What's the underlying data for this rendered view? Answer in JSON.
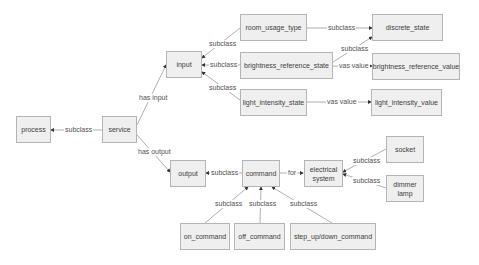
{
  "diagram": {
    "nodes": {
      "process": "process",
      "service": "service",
      "input": "input",
      "output": "output",
      "room_usage_type": "room_usage_type",
      "discrete_state": "discrete_state",
      "brightness_reference_state": "brightness_reference_state",
      "brightness_reference_value": "brightness_reference_value",
      "light_intensity_state": "light_intensity_state",
      "light_intensity_value": "light_intensity_value",
      "command": "command",
      "electrical_system": "electrical system",
      "socket": "socket",
      "dimmer_lamp": "dimmer lamp",
      "on_command": "on_command",
      "off_command": "off_command",
      "step_command": "step_up/down_command"
    },
    "edges": {
      "service_process": "subclass",
      "service_input": "has input",
      "service_output": "has output",
      "room_input": "subclass",
      "brightness_input": "subclass",
      "light_input": "subclass",
      "room_discrete": "subclass",
      "brightness_discrete": "subclass",
      "brightness_value": "vas value",
      "light_value": "vas value",
      "command_output": "subclass",
      "command_for": "for",
      "socket_electrical": "subclass",
      "dimmer_electrical": "subclass",
      "on_command": "subclass",
      "off_command": "subclass",
      "step_command": "subclass"
    },
    "colors": {
      "node_fill": "#efefef",
      "node_border": "#b4b4b4",
      "edge": "#9a9a9a",
      "arrow": "#333333",
      "text": "#404040"
    }
  }
}
